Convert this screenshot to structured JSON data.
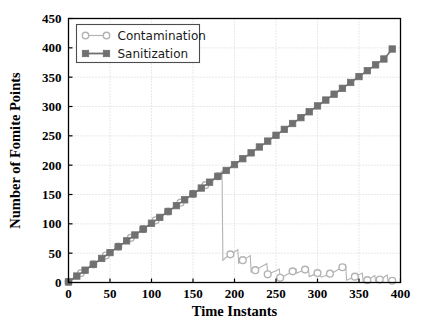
{
  "chart_data": {
    "type": "line",
    "title": "",
    "xlabel": "Time Instants",
    "ylabel": "Number of Fomite Points",
    "xlim": [
      0,
      400
    ],
    "ylim": [
      0,
      450
    ],
    "xticks": [
      0,
      50,
      100,
      150,
      200,
      250,
      300,
      350,
      400
    ],
    "yticks": [
      0,
      50,
      100,
      150,
      200,
      250,
      300,
      350,
      400,
      450
    ],
    "grid": true,
    "legend_position": "upper left",
    "series": [
      {
        "name": "Contamination",
        "color": "#b3b3b3",
        "marker": "circle",
        "marker_every": 15,
        "x": [
          0,
          5,
          10,
          15,
          20,
          25,
          30,
          35,
          40,
          45,
          50,
          55,
          60,
          65,
          70,
          75,
          80,
          85,
          90,
          95,
          100,
          105,
          110,
          115,
          120,
          125,
          130,
          135,
          140,
          145,
          150,
          155,
          160,
          165,
          170,
          175,
          180,
          185,
          186,
          190,
          195,
          200,
          204,
          205,
          210,
          215,
          219,
          220,
          225,
          230,
          235,
          239,
          240,
          245,
          250,
          254,
          255,
          260,
          265,
          270,
          274,
          275,
          280,
          285,
          289,
          290,
          295,
          300,
          305,
          310,
          315,
          320,
          325,
          330,
          334,
          335,
          340,
          345,
          350,
          354,
          355,
          360,
          365,
          369,
          370,
          375,
          380,
          384,
          385,
          390
        ],
        "y": [
          1,
          6,
          11,
          16,
          21,
          26,
          31,
          36,
          41,
          46,
          51,
          56,
          61,
          66,
          71,
          76,
          81,
          86,
          91,
          96,
          101,
          106,
          111,
          116,
          121,
          126,
          131,
          136,
          141,
          146,
          151,
          156,
          161,
          166,
          171,
          176,
          181,
          190,
          38,
          43,
          48,
          52,
          56,
          33,
          38,
          42,
          46,
          18,
          21,
          25,
          29,
          32,
          14,
          17,
          20,
          23,
          8,
          11,
          15,
          19,
          23,
          16,
          19,
          22,
          25,
          10,
          13,
          16,
          9,
          12,
          15,
          18,
          22,
          26,
          30,
          4,
          7,
          10,
          13,
          16,
          2,
          4,
          8,
          12,
          2,
          5,
          9,
          13,
          1,
          3
        ]
      },
      {
        "name": "Sanitization",
        "color": "#707070",
        "marker": "square",
        "marker_every": 10,
        "x": [
          0,
          5,
          10,
          15,
          20,
          25,
          30,
          35,
          40,
          45,
          50,
          55,
          60,
          65,
          70,
          75,
          80,
          85,
          90,
          95,
          100,
          105,
          110,
          115,
          120,
          125,
          130,
          135,
          140,
          145,
          150,
          155,
          160,
          165,
          170,
          175,
          180,
          185,
          190,
          195,
          200,
          205,
          210,
          215,
          220,
          225,
          230,
          235,
          240,
          245,
          250,
          255,
          260,
          265,
          270,
          275,
          280,
          285,
          290,
          295,
          300,
          305,
          310,
          315,
          320,
          325,
          330,
          335,
          340,
          345,
          350,
          355,
          360,
          365,
          370,
          375,
          380,
          385,
          390
        ],
        "y": [
          1,
          6,
          11,
          16,
          21,
          26,
          31,
          36,
          41,
          46,
          51,
          56,
          61,
          66,
          71,
          76,
          81,
          86,
          91,
          96,
          101,
          106,
          111,
          116,
          121,
          126,
          131,
          136,
          141,
          146,
          151,
          156,
          161,
          166,
          171,
          176,
          181,
          186,
          191,
          196,
          201,
          206,
          211,
          216,
          221,
          226,
          231,
          236,
          241,
          246,
          251,
          256,
          261,
          266,
          271,
          276,
          281,
          286,
          291,
          296,
          301,
          306,
          311,
          316,
          321,
          326,
          331,
          336,
          341,
          346,
          351,
          356,
          361,
          366,
          371,
          376,
          381,
          389,
          398
        ]
      }
    ]
  },
  "legend": {
    "entries": [
      {
        "label": "Contamination"
      },
      {
        "label": "Sanitization"
      }
    ]
  },
  "colors": {
    "contamination": "#b3b3b3",
    "sanitization": "#707070",
    "axis": "#000000",
    "grid": "#c8c8c8",
    "background": "#ffffff"
  }
}
